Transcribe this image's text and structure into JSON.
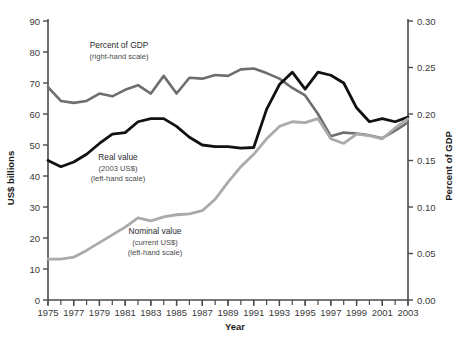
{
  "chart_data": {
    "type": "line",
    "title": "",
    "xlabel": "Year",
    "ylabel": "US$ billions",
    "y2label": "Percent of GDP",
    "xlim": [
      1975,
      2003
    ],
    "ylim": [
      0,
      90
    ],
    "y2lim": [
      0.0,
      0.3
    ],
    "grid": false,
    "legend_position": "inline-annotations",
    "x": [
      1975,
      1976,
      1977,
      1978,
      1979,
      1980,
      1981,
      1982,
      1983,
      1984,
      1985,
      1986,
      1987,
      1988,
      1989,
      1990,
      1991,
      1992,
      1993,
      1994,
      1995,
      1996,
      1997,
      1998,
      1999,
      2000,
      2001,
      2002,
      2003
    ],
    "xticks": [
      1975,
      1977,
      1979,
      1981,
      1983,
      1985,
      1987,
      1989,
      1991,
      1993,
      1995,
      1997,
      1999,
      2001,
      2003
    ],
    "xtick_labels": [
      "1975",
      "1977",
      "1979",
      "1981",
      "1983",
      "1985",
      "1987",
      "1989",
      "1991",
      "1993",
      "1995",
      "1997",
      "1999",
      "2001",
      "2003"
    ],
    "yticks": [
      0,
      10,
      20,
      30,
      40,
      50,
      60,
      70,
      80,
      90
    ],
    "ytick_labels": [
      "0",
      "10",
      "20",
      "30",
      "40",
      "50",
      "60",
      "70",
      "80",
      "90"
    ],
    "y2ticks": [
      0.0,
      0.05,
      0.1,
      0.15,
      0.2,
      0.25,
      0.3
    ],
    "y2tick_labels": [
      "0.00",
      "0.05",
      "0.10",
      "0.15",
      "0.20",
      "0.25",
      "0.30"
    ],
    "series": [
      {
        "name": "Percent of GDP",
        "axis": "right",
        "color": "#6e6e6e",
        "width": 2.6,
        "scale_note": "right-hand scale",
        "values": [
          0.229,
          0.214,
          0.212,
          0.214,
          0.222,
          0.219,
          0.226,
          0.231,
          0.222,
          0.241,
          0.222,
          0.239,
          0.238,
          0.242,
          0.241,
          0.248,
          0.249,
          0.244,
          0.238,
          0.228,
          0.22,
          0.2,
          0.176,
          0.18,
          0.179,
          0.177,
          0.174,
          0.182,
          0.191
        ]
      },
      {
        "name": "Real value (2003 US$)",
        "axis": "left",
        "color": "#111111",
        "width": 2.8,
        "scale_note": "left-hand scale",
        "values": [
          45.0,
          43.0,
          44.5,
          47.0,
          50.5,
          53.5,
          54.0,
          57.5,
          58.5,
          58.5,
          56.0,
          52.5,
          50.0,
          49.5,
          49.5,
          49.0,
          49.2,
          61.5,
          69.5,
          73.5,
          68.0,
          73.5,
          72.5,
          70.0,
          62.0,
          57.5,
          58.5,
          57.5,
          59.0
        ]
      },
      {
        "name": "Nominal value (current US$)",
        "axis": "left",
        "color": "#aaaaaa",
        "width": 2.8,
        "scale_note": "left-hand scale",
        "values": [
          13.2,
          13.2,
          13.8,
          16.0,
          18.5,
          21.0,
          23.5,
          26.5,
          25.5,
          26.8,
          27.5,
          27.8,
          28.8,
          32.5,
          38.0,
          43.0,
          47.0,
          52.0,
          56.0,
          57.5,
          57.2,
          58.5,
          52.0,
          50.5,
          53.5,
          53.0,
          52.0,
          55.5,
          58.5
        ]
      }
    ],
    "annotations": [
      {
        "id": "pct-gdp",
        "title": "Percent of GDP",
        "sub1": "(right-hand scale)",
        "sub2": "",
        "x": 119,
        "y": 48
      },
      {
        "id": "real-value",
        "title": "Real value",
        "sub1": "(2003 US$)",
        "sub2": "(left-hand scale)",
        "x": 118,
        "y": 160
      },
      {
        "id": "nominal-value",
        "title": "Nominal value",
        "sub1": "(current US$)",
        "sub2": "(left-hand scale)",
        "x": 155,
        "y": 234
      }
    ]
  }
}
